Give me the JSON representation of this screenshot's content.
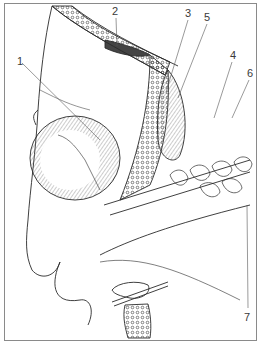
{
  "figure": {
    "type": "anatomical line illustration",
    "colors": {
      "ink": "#2a2a2a",
      "frame": "#8a8a8a",
      "background": "#ffffff",
      "label": "#3a3a3a"
    }
  },
  "labels": [
    {
      "id": "1",
      "text": "1",
      "x": 17,
      "y": 56,
      "line": [
        22,
        63,
        100,
        140
      ]
    },
    {
      "id": "2",
      "text": "2",
      "x": 112,
      "y": 6,
      "line": [
        116,
        18,
        117,
        46
      ]
    },
    {
      "id": "3",
      "text": "3",
      "x": 185,
      "y": 8,
      "line": [
        188,
        20,
        166,
        92
      ]
    },
    {
      "id": "5",
      "text": "5",
      "x": 204,
      "y": 12,
      "line": [
        207,
        24,
        178,
        98
      ]
    },
    {
      "id": "4",
      "text": "4",
      "x": 230,
      "y": 50,
      "line": [
        232,
        62,
        214,
        118
      ]
    },
    {
      "id": "6",
      "text": "6",
      "x": 247,
      "y": 68,
      "line": [
        249,
        80,
        232,
        118
      ]
    },
    {
      "id": "7",
      "text": "7",
      "x": 245,
      "y": 312,
      "line": [
        248,
        308,
        247,
        205
      ]
    }
  ]
}
